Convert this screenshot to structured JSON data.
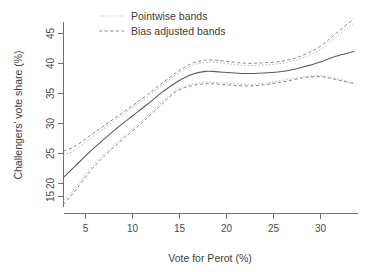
{
  "chart_data": {
    "type": "line",
    "title": "",
    "xlabel": "Vote for Perot (%)",
    "ylabel": "Challengers' vote share (%)",
    "xlim": [
      3.3,
      33.5
    ],
    "ylim": [
      13.0,
      48.5
    ],
    "xticks": [
      5,
      10,
      15,
      20,
      25,
      30
    ],
    "yticks": [
      15,
      20,
      25,
      30,
      35,
      40,
      45
    ],
    "xtick_labels": [
      "5",
      "10",
      "15",
      "20",
      "25",
      "30"
    ],
    "ytick_labels": [
      "15",
      "20",
      "25",
      "30",
      "35",
      "40",
      "45"
    ],
    "grid": false,
    "legend_position": "top-center",
    "legend": [
      {
        "label": "Pointwise bands",
        "style": "dotted",
        "color": "#c4c4c4"
      },
      {
        "label": "Bias adjusted bands",
        "style": "dashed",
        "color": "#8a8a8a"
      }
    ],
    "x": [
      3.3,
      4.5,
      6,
      7.5,
      9,
      10.5,
      12,
      13.5,
      15,
      16.5,
      18,
      19.5,
      21,
      22.5,
      24,
      25.5,
      27,
      28.5,
      30,
      31.5,
      33.4
    ],
    "series": [
      {
        "name": "Fitted curve",
        "style": "solid",
        "color": "#5a5a5a",
        "values": [
          18.5,
          20.6,
          23.2,
          25.6,
          27.9,
          30.0,
          32.1,
          34.3,
          36.2,
          37.6,
          38.2,
          38.1,
          37.9,
          37.8,
          37.9,
          38.1,
          38.5,
          39.2,
          40.0,
          41.0,
          41.9
        ]
      },
      {
        "name": "Pointwise band upper",
        "style": "dotted",
        "color": "#c4c4c4",
        "values": [
          22.6,
          23.6,
          25.6,
          27.6,
          29.6,
          31.5,
          33.5,
          35.6,
          37.6,
          39.2,
          39.9,
          39.8,
          39.5,
          39.3,
          39.4,
          39.6,
          40.1,
          41.0,
          42.4,
          44.5,
          47.2
        ]
      },
      {
        "name": "Pointwise band lower",
        "style": "dotted",
        "color": "#c4c4c4",
        "values": [
          14.2,
          16.6,
          20.0,
          22.8,
          25.3,
          27.6,
          30.0,
          32.5,
          34.8,
          35.8,
          36.2,
          36.1,
          35.9,
          35.8,
          36.0,
          36.4,
          36.9,
          37.3,
          37.4,
          36.9,
          36.1
        ]
      },
      {
        "name": "Bias adjusted band upper",
        "style": "dashed",
        "color": "#8a8a8a",
        "values": [
          23.4,
          24.3,
          26.2,
          28.1,
          30.0,
          31.9,
          33.9,
          36.0,
          38.0,
          39.6,
          40.3,
          40.2,
          39.9,
          39.7,
          39.8,
          40.0,
          40.5,
          41.5,
          43.0,
          45.2,
          48.0
        ]
      },
      {
        "name": "Bias adjusted band lower",
        "style": "dashed",
        "color": "#8a8a8a",
        "values": [
          13.5,
          16.0,
          19.5,
          22.4,
          24.9,
          27.2,
          29.6,
          32.1,
          34.5,
          35.5,
          35.9,
          35.8,
          35.6,
          35.5,
          35.7,
          36.1,
          36.6,
          37.1,
          37.2,
          36.7,
          35.9
        ]
      }
    ]
  },
  "axes": {
    "x_title": "Vote for Perot (%)",
    "y_title": "Challengers' vote share (%)"
  },
  "legend": {
    "entry_0": "Pointwise bands",
    "entry_1": "Bias adjusted bands"
  },
  "ticks": {
    "x": [
      "5",
      "10",
      "15",
      "20",
      "25",
      "30"
    ],
    "y": [
      "15",
      "20",
      "25",
      "30",
      "35",
      "40",
      "45"
    ]
  }
}
